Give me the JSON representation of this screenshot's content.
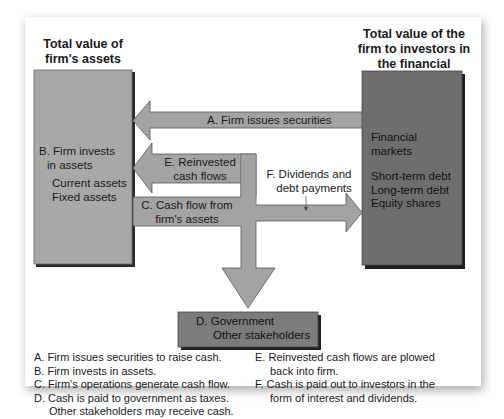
{
  "headers": {
    "left": [
      "Total value of",
      "firm's assets"
    ],
    "right": [
      "Total value of the",
      "firm to investors in",
      "the financial markets"
    ]
  },
  "left_box": {
    "title": [
      "B. Firm invests",
      "in assets"
    ],
    "items": [
      "Current assets",
      "Fixed assets"
    ]
  },
  "right_box": {
    "title": [
      "Financial",
      "markets"
    ],
    "items": [
      "Short-term debt",
      "Long-term debt",
      "Equity shares"
    ]
  },
  "gov_box": {
    "lines": [
      "D. Government",
      "Other stakeholders"
    ]
  },
  "arrows": {
    "a": "A. Firm issues securities",
    "e": [
      "E. Reinvested",
      "cash flows"
    ],
    "c": [
      "C. Cash flow from",
      "firm's assets"
    ],
    "f": [
      "F. Dividends and",
      "debt payments"
    ]
  },
  "legend": {
    "left": [
      {
        "text": "A. Firm issues securities to raise cash.",
        "indent": false
      },
      {
        "text": "B. Firm invests in assets.",
        "indent": false
      },
      {
        "text": "C. Firm's operations generate cash flow.",
        "indent": false
      },
      {
        "text": "D. Cash is paid to government as taxes.",
        "indent": false
      },
      {
        "text": "Other stakeholders may receive cash.",
        "indent": true
      }
    ],
    "right": [
      {
        "text": "E. Reinvested cash flows are plowed",
        "indent": false
      },
      {
        "text": "back into firm.",
        "indent": true
      },
      {
        "text": "F. Cash is paid out to investors in the",
        "indent": false
      },
      {
        "text": "form of interest and dividends.",
        "indent": true
      }
    ]
  },
  "colors": {
    "left_box": "#a8a8a8",
    "right_box": "#6e6e6e",
    "gov_box": "#7c7c7c",
    "arrow": "#a3a3a3",
    "outline": "#555555",
    "shadow": "#1e1e1e"
  }
}
